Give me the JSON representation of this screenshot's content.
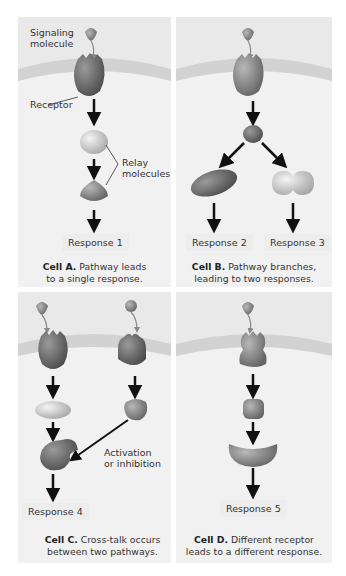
{
  "figure": {
    "panels": [
      {
        "id": "A",
        "labels": {
          "signaling_molecule": [
            "Signaling",
            "molecule"
          ],
          "receptor": "Receptor",
          "relay_molecules": [
            "Relay",
            "molecules"
          ]
        },
        "responses": [
          "Response 1"
        ],
        "caption_title": "Cell A.",
        "caption_text": [
          "Pathway leads",
          "to a single response."
        ]
      },
      {
        "id": "B",
        "responses": [
          "Response 2",
          "Response 3"
        ],
        "caption_title": "Cell B.",
        "caption_text": [
          "Pathway branches,",
          "leading to two responses."
        ]
      },
      {
        "id": "C",
        "labels": {
          "activation": [
            "Activation",
            "or inhibition"
          ]
        },
        "responses": [
          "Response 4"
        ],
        "caption_title": "Cell C.",
        "caption_text": [
          "Cross-talk occurs",
          "between two pathways."
        ]
      },
      {
        "id": "D",
        "responses": [
          "Response 5"
        ],
        "caption_title": "Cell D.",
        "caption_text": [
          "Different receptor",
          "leads to a different response."
        ]
      }
    ],
    "colors": {
      "panel_bg": "#e9e9e9",
      "membrane": "#d2d2d2",
      "molecule_dark": "#6a6a6a",
      "molecule_light": "#c8c8c8",
      "arrow": "#111111"
    }
  }
}
